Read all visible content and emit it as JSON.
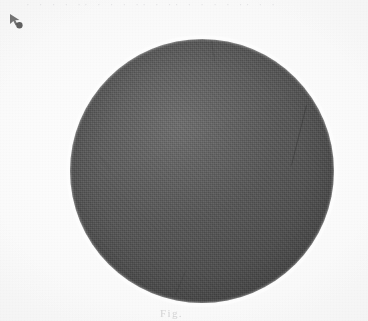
{
  "image": {
    "kind": "scanned-figure",
    "background_color": "#fcfcfc",
    "width_px": 368,
    "height_px": 321
  },
  "top_edge": {
    "name": "cut-off-header-text",
    "text": "· · · · ·· · · · ·· · ·· · · · · ·· · ·",
    "color": "#787882"
  },
  "corner_marker": {
    "name": "arrow-marker",
    "label": "A",
    "color": "#4a4a4a",
    "x_px": 6,
    "y_px": 11
  },
  "disc": {
    "name": "dark-circular-specimen",
    "center_x_px": 202,
    "center_y_px": 171,
    "radius_px": 132,
    "fill_color": "#565656",
    "highlight_color": "#6e6e6e",
    "shadow_color": "#4c4c4c",
    "edge": "soft-antialiased",
    "surface": "halftone-textured"
  },
  "cracks": [
    {
      "name": "crack-right",
      "opacity": 0.3
    },
    {
      "name": "crack-top",
      "opacity": 0.15
    },
    {
      "name": "crack-bottom",
      "opacity": 0.14
    },
    {
      "name": "crack-left",
      "opacity": 0.11
    }
  ],
  "bottom_caption": {
    "name": "cropped-caption",
    "text": "Fig.",
    "color": "#6e6e73"
  }
}
